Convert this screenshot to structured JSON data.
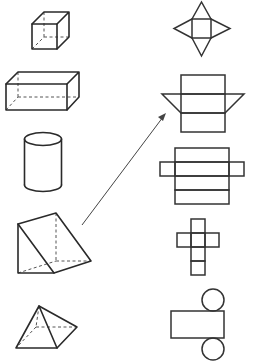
{
  "diagram": {
    "title": "Match 3D solids to their nets",
    "layout": "two columns: solids on the left, nets on the right",
    "solids": [
      {
        "id": "cube",
        "label": "Cube"
      },
      {
        "id": "rectangular-prism",
        "label": "Rectangular prism (cuboid)"
      },
      {
        "id": "cylinder",
        "label": "Cylinder"
      },
      {
        "id": "triangular-prism",
        "label": "Triangular prism"
      },
      {
        "id": "square-pyramid",
        "label": "Square pyramid"
      }
    ],
    "nets": [
      {
        "id": "net-square-pyramid",
        "label": "Square with four triangles"
      },
      {
        "id": "net-triangular-prism",
        "label": "Three rectangles with two triangles"
      },
      {
        "id": "net-rectangular-prism",
        "label": "Four stacked rectangles with two side flaps"
      },
      {
        "id": "net-cube",
        "label": "Six squares in a cross"
      },
      {
        "id": "net-cylinder",
        "label": "Rectangle with two circles"
      }
    ],
    "connections": [
      {
        "from": "triangular-prism",
        "to": "net-triangular-prism",
        "style": "arrow"
      }
    ],
    "colors": {
      "stroke": "#2a2a2a",
      "hidden_edge": "#555555",
      "background": "#ffffff"
    }
  }
}
